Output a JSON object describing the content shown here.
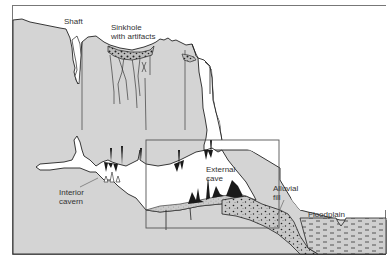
{
  "diagram": {
    "type": "geological cross-section",
    "colors": {
      "rock": "#d4d4d4",
      "cave_void": "#ffffff",
      "sky": "#ffffff",
      "outline": "#222222",
      "frame": "#777777",
      "fill_deposit": "#c8c8c8",
      "speleothem": "#1a1a1a"
    },
    "labels": {
      "shaft": "Shaft",
      "sinkhole": "Sinkhole\nwith artifacts",
      "interior_cavern": "Interior\ncavern",
      "external_cave": "External\ncave",
      "alluvial_fill": "Alluvial\nfill",
      "floodplain": "Floodplain"
    },
    "inset_box": {
      "x": 146,
      "y": 140,
      "width": 133,
      "height": 88,
      "meaning": "highlighted external cave area"
    }
  }
}
